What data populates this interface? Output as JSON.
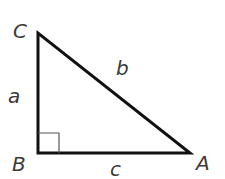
{
  "diagram": {
    "type": "right-triangle",
    "vertices": {
      "C": {
        "label": "C",
        "x": 38,
        "y": 33
      },
      "B": {
        "label": "B",
        "x": 38,
        "y": 153
      },
      "A": {
        "label": "A",
        "x": 190,
        "y": 153
      }
    },
    "sides": {
      "a": {
        "label": "a",
        "between": [
          "B",
          "C"
        ]
      },
      "b": {
        "label": "b",
        "between": [
          "C",
          "A"
        ]
      },
      "c": {
        "label": "c",
        "between": [
          "B",
          "A"
        ]
      }
    },
    "right_angle_at": "B",
    "colors": {
      "stroke": "#111111",
      "label": "#3a3a3a",
      "right_angle_marker": "#555555"
    }
  }
}
